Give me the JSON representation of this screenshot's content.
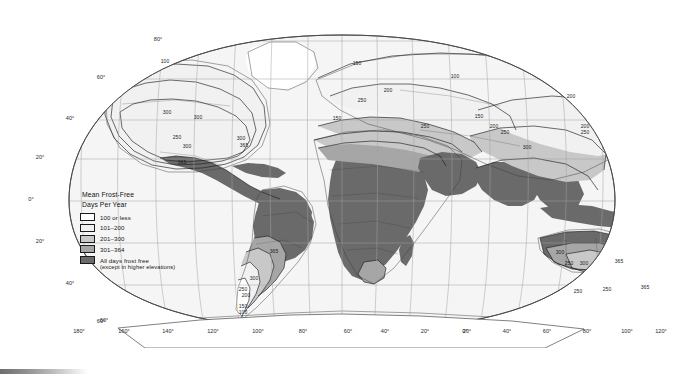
{
  "figure": {
    "kind": "thematic-world-map",
    "projection": "robinson-style oval world map",
    "background_color": "#ffffff",
    "ocean_color": "#f4f4f4",
    "graticule_color": "#b6b6b6",
    "coastline_color": "#3a3a3a",
    "border_color": "#2a2a2a"
  },
  "legend": {
    "title_line1": "Mean Frost-Free",
    "title_line2": "Days Per Year",
    "entries": [
      {
        "label": "100 or less",
        "sub": "",
        "color": "#ffffff"
      },
      {
        "label": "101–200",
        "sub": "",
        "color": "#f1f1f1"
      },
      {
        "label": "201–300",
        "sub": "",
        "color": "#c8c8c8"
      },
      {
        "label": "301–364",
        "sub": "",
        "color": "#a6a6a6"
      },
      {
        "label": "All days frost free",
        "sub": "(except in higher elevations)",
        "color": "#6b6b6b"
      }
    ]
  },
  "axes": {
    "latitude_labels": [
      {
        "text": "80°",
        "x": 158,
        "y": 41
      },
      {
        "text": "60°",
        "x": 101,
        "y": 79
      },
      {
        "text": "40°",
        "x": 70,
        "y": 120
      },
      {
        "text": "20°",
        "x": 40,
        "y": 159
      },
      {
        "text": "0°",
        "x": 31,
        "y": 201
      },
      {
        "text": "20°",
        "x": 40,
        "y": 243
      },
      {
        "text": "40°",
        "x": 70,
        "y": 285
      },
      {
        "text": "60°",
        "x": 101,
        "y": 323
      }
    ],
    "longitude_labels": [
      {
        "text": "180°",
        "x": 79
      },
      {
        "text": "160°",
        "x": 124
      },
      {
        "text": "140°",
        "x": 168
      },
      {
        "text": "120°",
        "x": 213
      },
      {
        "text": "100°",
        "x": 258
      },
      {
        "text": "80°",
        "x": 303
      },
      {
        "text": "60°",
        "x": 348
      },
      {
        "text": "40°",
        "x": 385
      },
      {
        "text": "20°",
        "x": 425
      },
      {
        "text": "0°",
        "x": 465
      },
      {
        "text": "20°",
        "x": 467
      },
      {
        "text": "40°",
        "x": 507
      },
      {
        "text": "60°",
        "x": 547
      },
      {
        "text": "80°",
        "x": 587
      },
      {
        "text": "100°",
        "x": 627
      },
      {
        "text": "120°",
        "x": 661
      },
      {
        "text": "140°",
        "x": 690
      },
      {
        "text": "160°",
        "x": 718
      },
      {
        "text": "180°",
        "x": 745
      }
    ],
    "longitude_label_y": 333,
    "bottom_left_extra": {
      "text": "60°",
      "x": 104,
      "y": 322
    }
  },
  "contour_labels": [
    {
      "text": "100",
      "x": 165,
      "y": 63
    },
    {
      "text": "300",
      "x": 167,
      "y": 114
    },
    {
      "text": "300",
      "x": 198,
      "y": 119
    },
    {
      "text": "250",
      "x": 177,
      "y": 139
    },
    {
      "text": "300",
      "x": 187,
      "y": 148
    },
    {
      "text": "300",
      "x": 241,
      "y": 140
    },
    {
      "text": "365",
      "x": 244,
      "y": 147
    },
    {
      "text": "365",
      "x": 182,
      "y": 164
    },
    {
      "text": "365",
      "x": 274,
      "y": 253
    },
    {
      "text": "300",
      "x": 254,
      "y": 280
    },
    {
      "text": "250",
      "x": 243,
      "y": 291
    },
    {
      "text": "200",
      "x": 246,
      "y": 297
    },
    {
      "text": "150",
      "x": 243,
      "y": 308
    },
    {
      "text": "100",
      "x": 243,
      "y": 314
    },
    {
      "text": "150",
      "x": 357,
      "y": 65
    },
    {
      "text": "200",
      "x": 388,
      "y": 92
    },
    {
      "text": "250",
      "x": 362,
      "y": 102
    },
    {
      "text": "100",
      "x": 455,
      "y": 78
    },
    {
      "text": "150",
      "x": 337,
      "y": 120
    },
    {
      "text": "250",
      "x": 425,
      "y": 128
    },
    {
      "text": "150",
      "x": 479,
      "y": 118
    },
    {
      "text": "200",
      "x": 494,
      "y": 128
    },
    {
      "text": "250",
      "x": 505,
      "y": 134
    },
    {
      "text": "300",
      "x": 527,
      "y": 149
    },
    {
      "text": "200",
      "x": 571,
      "y": 98
    },
    {
      "text": "200",
      "x": 585,
      "y": 128
    },
    {
      "text": "250",
      "x": 585,
      "y": 134
    },
    {
      "text": "300",
      "x": 560,
      "y": 254
    },
    {
      "text": "250",
      "x": 569,
      "y": 265
    },
    {
      "text": "300",
      "x": 584,
      "y": 265
    },
    {
      "text": "365",
      "x": 619,
      "y": 263
    },
    {
      "text": "250",
      "x": 578,
      "y": 293
    },
    {
      "text": "250",
      "x": 607,
      "y": 291
    },
    {
      "text": "365",
      "x": 645,
      "y": 289
    }
  ],
  "chart_data": {
    "type": "map",
    "title": "Mean Frost-Free Days Per Year",
    "classes": [
      "100 or less",
      "101-200",
      "201-300",
      "301-364",
      "All days frost free (except in higher elevations)"
    ],
    "class_colors": [
      "#ffffff",
      "#f1f1f1",
      "#c8c8c8",
      "#a6a6a6",
      "#6b6b6b"
    ],
    "contour_values": [
      100,
      150,
      200,
      250,
      300,
      365
    ],
    "graticule_latitudes": [
      80,
      60,
      40,
      20,
      0,
      -20,
      -40,
      -60
    ],
    "graticule_longitudes": [
      -180,
      -160,
      -140,
      -120,
      -100,
      -80,
      -60,
      -40,
      -20,
      0,
      20,
      40,
      60,
      80,
      100,
      120,
      140,
      160,
      180
    ]
  }
}
